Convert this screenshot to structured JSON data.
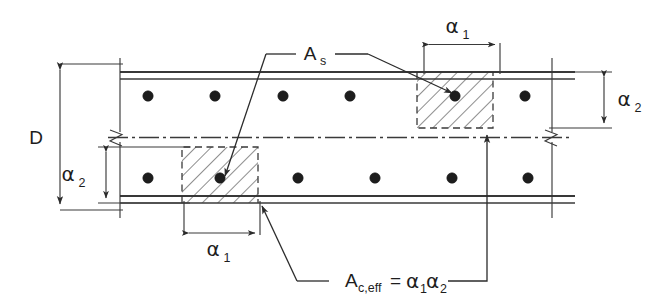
{
  "figure": {
    "type": "engineering-cross-section",
    "background_color": "#ffffff",
    "line_color": "#2b2b2b"
  },
  "labels": {
    "depth": "D",
    "steel_area": "A",
    "steel_area_sub": "s",
    "alpha": "α",
    "alpha1_sub": "1",
    "alpha2_sub": "2",
    "eff_area_main": "A",
    "eff_area_sub": "c,eff",
    "equals": "=",
    "eff_area_expr_alpha": "α"
  },
  "dimensions": [
    {
      "name": "overall-depth",
      "label": "D",
      "position": "left",
      "orientation": "vertical"
    },
    {
      "name": "alpha2-top",
      "label": "α2",
      "position": "right",
      "orientation": "vertical"
    },
    {
      "name": "alpha2-bottom",
      "label": "α2",
      "position": "left-inner",
      "orientation": "vertical"
    },
    {
      "name": "alpha1-top",
      "label": "α1",
      "position": "top",
      "orientation": "horizontal"
    },
    {
      "name": "alpha1-bottom",
      "label": "α1",
      "position": "bottom",
      "orientation": "horizontal"
    }
  ],
  "annotations": [
    {
      "name": "steel-area-callout",
      "text": "As",
      "targets": [
        "top-hatched-rebar",
        "bottom-hatched-rebar"
      ]
    },
    {
      "name": "effective-area-callout",
      "text": "Ac,eff = α1α2",
      "targets": [
        "bottom-hatched-region",
        "top-hatched-region"
      ]
    }
  ],
  "rebar": {
    "top_row_count": 6,
    "bottom_row_count": 6,
    "top_row_x": [
      148,
      215,
      283,
      350,
      418,
      492
    ],
    "bottom_row_x": [
      148,
      215,
      283,
      350,
      418,
      492
    ],
    "top_row_y": 96,
    "bottom_row_y": 178,
    "radius": 5.2
  },
  "hatched_regions": [
    {
      "name": "top-effective-area",
      "x": 417,
      "y": 72,
      "width": 76,
      "height": 56
    },
    {
      "name": "bottom-effective-area",
      "x": 182,
      "y": 147,
      "width": 76,
      "height": 56
    }
  ],
  "break_symbols": [
    {
      "name": "left-break",
      "x": 120,
      "y": 137
    },
    {
      "name": "right-break",
      "x": 552,
      "y": 137
    }
  ]
}
